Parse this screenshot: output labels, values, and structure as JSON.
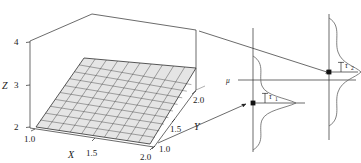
{
  "figure": {
    "title": "",
    "panels": {
      "surface3d": {
        "name": "3d-regression-surface",
        "axes": {
          "z": {
            "label": "Z",
            "ticks": [
              "2",
              "3",
              "4"
            ],
            "range": [
              2,
              4
            ]
          },
          "x": {
            "label": "X",
            "ticks": [
              "1.0",
              "1.5",
              "2.0"
            ],
            "range": [
              1.0,
              2.0
            ]
          },
          "y": {
            "label": "Y",
            "ticks": [
              "1.0",
              "1.5",
              "2.0"
            ],
            "range": [
              1.0,
              2.0
            ]
          }
        },
        "surface": {
          "type": "planar-mesh",
          "grid_rows": 10,
          "grid_cols": 10,
          "fill": "#e2e2e2",
          "stroke": "#2a2a2a"
        }
      },
      "distribution_near": {
        "name": "distribution-curve-1",
        "mean_label": "μ",
        "sd_label": "τ",
        "sd_subscript": "1",
        "point_label": ""
      },
      "distribution_far": {
        "name": "distribution-curve-2",
        "sd_label": "τ",
        "sd_subscript": "2",
        "point_label": ""
      }
    },
    "colors": {
      "line": "#222222",
      "surface_fill": "#e4e4e4",
      "surface_grid": "#303030",
      "curve": "#555555",
      "axis": "#333333"
    }
  }
}
